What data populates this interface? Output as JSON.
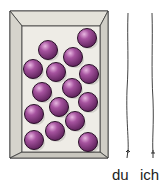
{
  "illustration": {
    "box": {
      "fill": "#e6e4dc",
      "inner_fill": "#f0eee8",
      "stroke": "#3a3a3a"
    },
    "ball_color": "#8a3f85",
    "ball_count": 15,
    "balls": [
      [
        87,
        38
      ],
      [
        48,
        50
      ],
      [
        73,
        57
      ],
      [
        33,
        69
      ],
      [
        56,
        72
      ],
      [
        89,
        74
      ],
      [
        42,
        92
      ],
      [
        72,
        88
      ],
      [
        88,
        102
      ],
      [
        59,
        107
      ],
      [
        34,
        114
      ],
      [
        75,
        121
      ],
      [
        55,
        131
      ],
      [
        34,
        140
      ],
      [
        88,
        142
      ]
    ]
  },
  "strings": [
    {
      "label": "du"
    },
    {
      "label": "ich"
    }
  ]
}
